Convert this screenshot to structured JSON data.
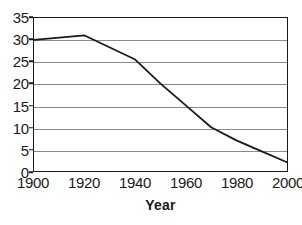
{
  "chart_data": {
    "type": "line",
    "title": "",
    "xlabel": "Year",
    "ylabel": "",
    "x": [
      1900,
      1920,
      1940,
      1950,
      1960,
      1970,
      1980,
      1990,
      2000
    ],
    "values": [
      30,
      31,
      25.5,
      20,
      15,
      10,
      7,
      4.5,
      2
    ],
    "series": [
      {
        "name": "",
        "x": [
          1900,
          1920,
          1940,
          1950,
          1960,
          1970,
          1980,
          1990,
          2000
        ],
        "values": [
          30,
          31,
          25.5,
          20,
          15,
          10,
          7,
          4.5,
          2
        ]
      }
    ],
    "xlim": [
      1900,
      2000
    ],
    "ylim": [
      0,
      35
    ],
    "x_ticks": [
      1900,
      1920,
      1940,
      1960,
      1980,
      2000
    ],
    "x_tick_labels": [
      "1900",
      "1920",
      "1940",
      "1960",
      "1980",
      "2000"
    ],
    "y_ticks": [
      0,
      5,
      10,
      15,
      20,
      25,
      30,
      35
    ],
    "y_tick_labels": [
      "0",
      "5",
      "10",
      "15",
      "20",
      "25",
      "30",
      "35"
    ],
    "grid": "horizontal",
    "legend": "none",
    "line_color": "#1a1a1a",
    "grid_color": "#8a8a8a",
    "axis_color": "#1a1a1a",
    "background_color": "#ffffff"
  }
}
